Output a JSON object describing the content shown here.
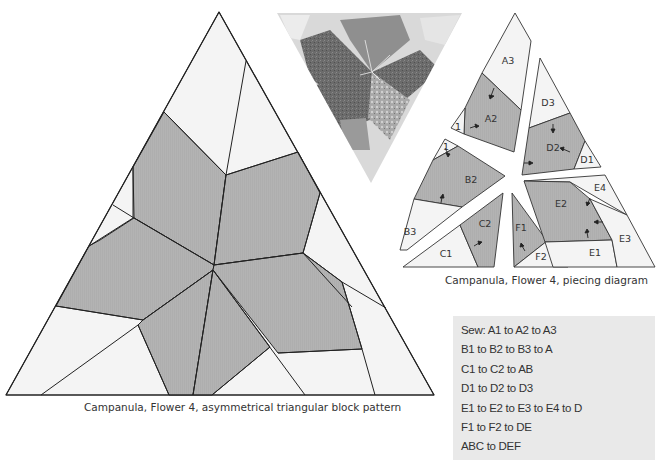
{
  "block_pattern": {
    "caption": "Campanula, Flower 4, asymmetrical triangular block pattern",
    "colors": {
      "background_fabric": "#f3f3f3",
      "flower_fabric": "#b3b3b3",
      "line": "#222222"
    }
  },
  "photo": {
    "description": "Inverted triangle photo of finished quilt block with flower"
  },
  "piecing_diagram": {
    "caption": "Campanula, Flower 4, piecing diagram",
    "labels": {
      "A3": "A3",
      "A2": "A2",
      "A1": "1",
      "B1": "1",
      "B2": "B2",
      "B3": "B3",
      "C1": "C1",
      "C2": "C2",
      "D1": "D1",
      "D2": "D2",
      "D3": "D3",
      "E1": "E1",
      "E2": "E2",
      "E3": "E3",
      "E4": "E4",
      "F1": "F1",
      "F2": "F2"
    }
  },
  "sewing_instructions": {
    "lines": [
      "Sew: A1 to A2 to A3",
      "B1 to B2 to B3 to A",
      "C1 to C2 to AB",
      "D1 to D2 to D3",
      "E1 to E2 to E3 to E4 to D",
      "F1 to F2 to DE",
      "ABC to DEF"
    ]
  }
}
